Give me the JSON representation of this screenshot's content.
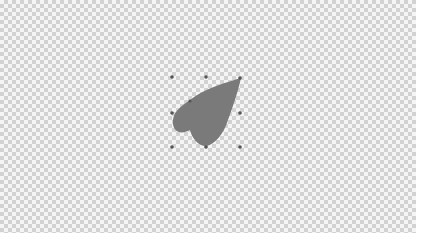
{
  "canvas": {
    "background": "transparent-checkerboard",
    "checker_light": "#f5f5f5",
    "checker_dark": "#d2d2d2"
  },
  "shape": {
    "type": "heart-leaf",
    "fill": "#7a7a7a",
    "selected": true
  },
  "selection": {
    "bounding_box": {
      "x": 172,
      "y": 77,
      "width": 68,
      "height": 70
    },
    "handle_color": "#555555",
    "handles": [
      {
        "name": "top-left",
        "x": 172,
        "y": 77
      },
      {
        "name": "top-center",
        "x": 206,
        "y": 77
      },
      {
        "name": "top-right",
        "x": 240,
        "y": 78
      },
      {
        "name": "middle-left",
        "x": 172,
        "y": 113
      },
      {
        "name": "middle-right",
        "x": 240,
        "y": 113
      },
      {
        "name": "bottom-left",
        "x": 172,
        "y": 147
      },
      {
        "name": "bottom-center",
        "x": 206,
        "y": 147
      },
      {
        "name": "bottom-right",
        "x": 240,
        "y": 147
      }
    ]
  }
}
